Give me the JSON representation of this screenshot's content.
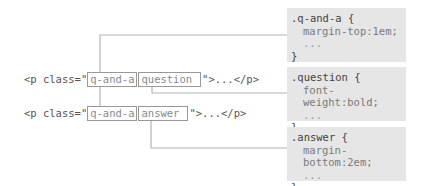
{
  "html_lines": [
    {
      "prefix": "<p class=\"",
      "classes": [
        "q-and-a",
        "question"
      ],
      "suffix": "\">...</p>"
    },
    {
      "prefix": "<p class=\"",
      "classes": [
        "q-and-a",
        "answer"
      ],
      "suffix": "\">...</p>"
    }
  ],
  "css_rules": [
    {
      "selector": ".q-and-a {",
      "property": "margin-top:1em;",
      "ellipsis": "...",
      "close": "}"
    },
    {
      "selector": ".question {",
      "property": "font-weight:bold;",
      "ellipsis": "...",
      "close": "}"
    },
    {
      "selector": ".answer {",
      "property": "margin-bottom:2em;",
      "ellipsis": "...",
      "close": "}"
    }
  ],
  "colors": {
    "line": "#b3b3b3",
    "box_bg": "#e6e6e6",
    "box_border": "#999999"
  }
}
